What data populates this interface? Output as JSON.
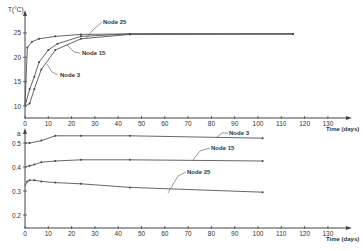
{
  "chart_data": [
    {
      "type": "line",
      "title": "",
      "xlabel": "Time (days)",
      "ylabel": "T(°C)",
      "xlim": [
        0,
        135
      ],
      "ylim": [
        10,
        25
      ],
      "x_ticks": [
        "0",
        "10",
        "20",
        "30",
        "40",
        "50",
        "60",
        "70",
        "80",
        "90",
        "100",
        "110",
        "120",
        "130"
      ],
      "y_ticks": [
        "10",
        "15",
        "20",
        "25"
      ],
      "grid": false,
      "series": [
        {
          "name": "Node 25",
          "x": [
            0,
            1,
            3,
            6,
            13,
            24,
            45,
            115
          ],
          "y": [
            10,
            22.0,
            23.2,
            23.8,
            24.3,
            24.7,
            24.8,
            24.8
          ]
        },
        {
          "name": "Node 15",
          "x": [
            0,
            2,
            4,
            6,
            10,
            14,
            24,
            45,
            115
          ],
          "y": [
            10,
            13.5,
            16.0,
            19.0,
            21.5,
            22.8,
            24.3,
            24.8,
            24.8
          ]
        },
        {
          "name": "Node 3",
          "x": [
            0,
            2,
            4,
            7,
            13,
            24,
            45,
            115
          ],
          "y": [
            10,
            10.5,
            13.5,
            17.5,
            21.5,
            23.8,
            24.7,
            24.8
          ]
        }
      ],
      "annotations": [
        "Node 25",
        "Node 15",
        "Node 3"
      ]
    },
    {
      "type": "line",
      "title": "",
      "xlabel": "Time (days)",
      "ylabel": "a",
      "xlim": [
        0,
        135
      ],
      "ylim": [
        0.15,
        0.55
      ],
      "x_ticks": [
        "0",
        "10",
        "20",
        "30",
        "40",
        "50",
        "60",
        "70",
        "80",
        "90",
        "100",
        "110",
        "120",
        "130"
      ],
      "y_ticks": [
        "0.2",
        "0.3",
        "0.4",
        "0.5"
      ],
      "grid": false,
      "series": [
        {
          "name": "Node 3",
          "x": [
            0,
            2,
            7,
            13,
            24,
            45,
            102
          ],
          "y": [
            0.5,
            0.5,
            0.51,
            0.53,
            0.53,
            0.53,
            0.52
          ]
        },
        {
          "name": "Node 15",
          "x": [
            0,
            2,
            4,
            7,
            13,
            24,
            45,
            102
          ],
          "y": [
            0.4,
            0.405,
            0.41,
            0.42,
            0.425,
            0.43,
            0.43,
            0.425
          ]
        },
        {
          "name": "Node 25",
          "x": [
            0,
            1,
            2,
            4,
            7,
            13,
            24,
            45,
            102
          ],
          "y": [
            0.32,
            0.34,
            0.345,
            0.345,
            0.34,
            0.335,
            0.33,
            0.315,
            0.295
          ]
        }
      ],
      "annotations": [
        "Node 3",
        "Node 15",
        "Node 25"
      ]
    }
  ],
  "labels": {
    "top_ylabel": "T(°C)",
    "bottom_ylabel": "a",
    "xlabel": "Time (days)",
    "node25": "Node 25",
    "node15": "Node 15",
    "node3": "Node 3"
  }
}
